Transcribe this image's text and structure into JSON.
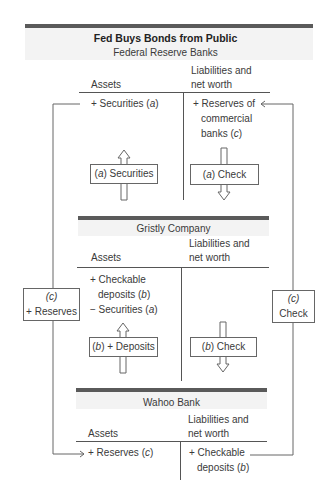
{
  "title": "Fed Buys Bonds from Public",
  "sections": [
    {
      "name": "Federal Reserve Banks",
      "col_headers": {
        "assets": "Assets",
        "liabilities_line1": "Liabilities and",
        "liabilities_line2": "net worth"
      },
      "assets": [
        {
          "sign": "+",
          "text": "Securities",
          "tag": "a"
        }
      ],
      "liabilities": [
        {
          "sign": "+",
          "lines": [
            "Reserves of",
            "commercial",
            "banks"
          ],
          "tag": "c"
        }
      ],
      "flows": [
        {
          "tag": "a",
          "label": "Securities",
          "direction": "up"
        },
        {
          "tag": "a",
          "label": "Check",
          "direction": "down"
        }
      ]
    },
    {
      "name": "Gristly Company",
      "col_headers": {
        "assets": "Assets",
        "liabilities_line1": "Liabilities and",
        "liabilities_line2": "net worth"
      },
      "assets": [
        {
          "sign": "+",
          "lines": [
            "Checkable",
            "deposits"
          ],
          "tag": "b"
        },
        {
          "sign": "−",
          "text": "Securities",
          "tag": "a"
        }
      ],
      "liabilities": [],
      "flows": [
        {
          "tag": "b",
          "label": "+ Deposits",
          "direction": "up"
        },
        {
          "tag": "b",
          "label": "Check",
          "direction": "down"
        }
      ]
    },
    {
      "name": "Wahoo Bank",
      "col_headers": {
        "assets": "Assets",
        "liabilities_line1": "Liabilities and",
        "liabilities_line2": "net worth"
      },
      "assets": [
        {
          "sign": "+",
          "text": "Reserves",
          "tag": "c"
        }
      ],
      "liabilities": [
        {
          "sign": "+",
          "lines": [
            "Checkable",
            "deposits"
          ],
          "tag": "b"
        }
      ]
    }
  ],
  "side_boxes": {
    "left": {
      "tag": "(c)",
      "label": "+ Reserves"
    },
    "right": {
      "tag": "(c)",
      "label": "Check"
    }
  },
  "strings": {
    "fed_asset": "+ Securities (",
    "fed_liab_1": "+ Reserves of",
    "fed_liab_2": "commercial",
    "fed_liab_3": "banks (",
    "g_asset_1": "+ Checkable",
    "g_asset_2": "deposits (",
    "g_asset_3": "− Securities (",
    "w_asset": "+ Reserves (",
    "w_liab_1": "+ Checkable",
    "w_liab_2": "deposits (",
    "close": ")",
    "open": "(",
    "a": "a",
    "b": "b",
    "c": "c",
    "sec_label": ") Securities",
    "check_label": ") Check",
    "dep_label": ") + Deposits"
  }
}
